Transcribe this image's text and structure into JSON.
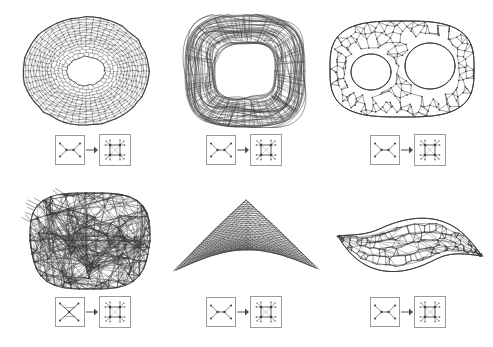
{
  "figure": {
    "title_sliver": "",
    "background": "#ffffff",
    "ink_color": "#3a3a3a",
    "box_border_color": "#9a9a9a",
    "panel_count": 6,
    "rows": 2,
    "columns": 3
  },
  "panels": [
    {
      "id": "panel-top-left",
      "position": "top-left",
      "shape_name": "torus-dense-mesh",
      "description": "dense circular torus mesh with single central hole",
      "topology": "genus-1",
      "mesh_density": "very-high",
      "legend": {
        "source_motif": "uncrossed-pair",
        "source_glyph": ")-(",
        "arrow_glyph": "→",
        "result_motif": "four-node-grid",
        "result_glyph": "::"
      }
    },
    {
      "id": "panel-top-middle",
      "position": "top-middle",
      "shape_name": "rounded-square-ring",
      "description": "rounded square annulus ring, wide band, sparse long strands",
      "topology": "genus-1",
      "mesh_density": "medium",
      "legend": {
        "source_motif": "uncrossed-pair",
        "source_glyph": ")-(",
        "arrow_glyph": "→",
        "result_motif": "four-node-grid",
        "result_glyph": "::"
      }
    },
    {
      "id": "panel-top-right",
      "position": "top-right",
      "shape_name": "double-torus-mesh",
      "description": "genus-2 double torus, two holes, polygonal cell structure",
      "topology": "genus-2",
      "mesh_density": "low",
      "legend": {
        "source_motif": "uncrossed-pair",
        "source_glyph": ")-(",
        "arrow_glyph": "→",
        "result_motif": "four-node-grid",
        "result_glyph": "::"
      }
    },
    {
      "id": "panel-bottom-left",
      "position": "bottom-left",
      "shape_name": "tangled-blob",
      "description": "dense tangled cube-like blob with many crossing long edges",
      "topology": "tangled",
      "mesh_density": "very-high",
      "legend": {
        "source_motif": "crossed-pair",
        "source_glyph": "X",
        "arrow_glyph": "→",
        "result_motif": "four-node-grid",
        "result_glyph": "::"
      }
    },
    {
      "id": "panel-bottom-middle",
      "position": "bottom-middle",
      "shape_name": "triangular-dome-mesh",
      "description": "regular fine triangular dome with concave lower edge",
      "topology": "disc",
      "mesh_density": "very-high-regular",
      "legend": {
        "source_motif": "uncrossed-pair",
        "source_glyph": ")-(",
        "arrow_glyph": "→",
        "result_motif": "four-node-grid",
        "result_glyph": "::"
      }
    },
    {
      "id": "panel-bottom-right",
      "position": "bottom-right",
      "shape_name": "leaf-lens-mesh",
      "description": "leaf / lens shape with pointed tips and irregular open cells",
      "topology": "disc",
      "mesh_density": "medium",
      "legend": {
        "source_motif": "uncrossed-pair",
        "source_glyph": ")-(",
        "arrow_glyph": "→",
        "result_motif": "four-node-grid",
        "result_glyph": "::"
      }
    }
  ]
}
